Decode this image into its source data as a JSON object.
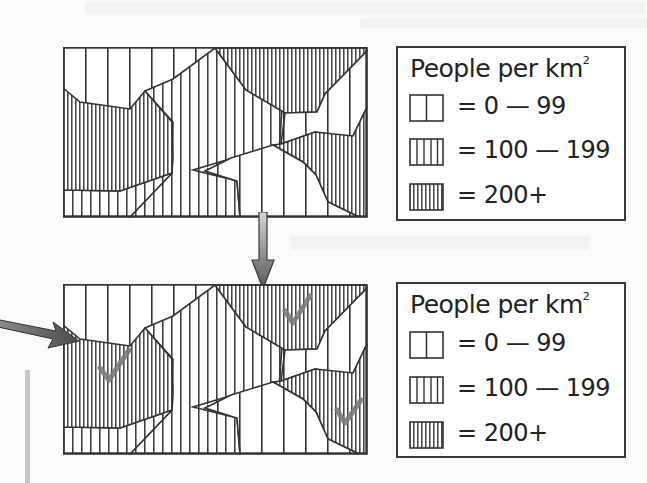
{
  "figure": {
    "maps": [
      {
        "id": "map-original",
        "checkmarks": false
      },
      {
        "id": "map-annotated",
        "checkmarks": true,
        "checkmark_count": 3
      }
    ],
    "legend": {
      "title": "People per km",
      "title_superscript": "2",
      "items": [
        {
          "label": "= 0 — 99",
          "pattern": "sparse-vertical-lines"
        },
        {
          "label": "= 100 — 199",
          "pattern": "medium-vertical-lines"
        },
        {
          "label": "= 200+",
          "pattern": "dense-vertical-lines"
        }
      ]
    },
    "arrows": [
      {
        "name": "down-arrow",
        "from": "map-original",
        "to": "map-annotated"
      },
      {
        "name": "pointer-arrow",
        "points_to": "map-annotated-left-edge"
      }
    ],
    "colors": {
      "line": "#3a3a3a",
      "arrow_light": "#c9c9c9",
      "arrow_dark": "#555555",
      "checkmark": "#777777",
      "side_bar": "#c7c7c7"
    }
  }
}
